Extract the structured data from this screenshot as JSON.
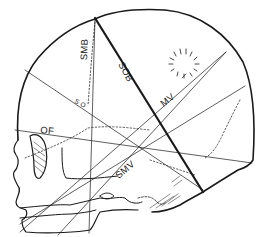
{
  "figure": {
    "labels": {
      "smb": "SMB",
      "sob": "SOB",
      "mv": "MV",
      "of": "OF",
      "smv": "SMV",
      "so": "S O"
    }
  },
  "colors": {
    "ink": "#1a1a1a",
    "background": "#ffffff"
  }
}
